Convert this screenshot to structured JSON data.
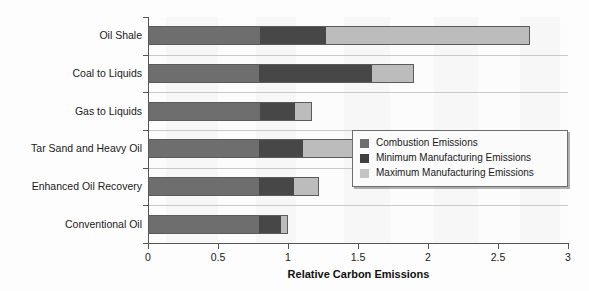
{
  "chart_data": {
    "type": "bar",
    "orientation": "horizontal",
    "stacked": true,
    "title": "",
    "xlabel": "Relative Carbon Emissions",
    "ylabel": "",
    "xlim": [
      0,
      3
    ],
    "xticks": [
      "0",
      "0.5",
      "1",
      "1.5",
      "2",
      "2.5",
      "3"
    ],
    "xtick_values": [
      0,
      0.5,
      1,
      1.5,
      2,
      2.5,
      3
    ],
    "grid": true,
    "grid_axis": "y",
    "legend_position": "center-right",
    "categories": [
      "Oil Shale",
      "Coal to Liquids",
      "Gas to Liquids",
      "Tar Sand and Heavy Oil",
      "Enhanced Oil Recovery",
      "Conventional Oil"
    ],
    "series": [
      {
        "name": "Combustion Emissions",
        "color": "#6e6e6e",
        "values": [
          0.8,
          0.79,
          0.8,
          0.79,
          0.79,
          0.79
        ]
      },
      {
        "name": "Minimum Manufacturing Emissions",
        "color": "#474747",
        "values": [
          0.47,
          0.81,
          0.25,
          0.32,
          0.25,
          0.16
        ]
      },
      {
        "name": "Maximum Manufacturing Emissions",
        "color": "#bcbcbc",
        "values": [
          1.46,
          0.3,
          0.12,
          0.37,
          0.18,
          0.05
        ]
      }
    ],
    "cumulative_totals": [
      [
        0.8,
        1.27,
        2.73
      ],
      [
        0.79,
        1.6,
        1.9
      ],
      [
        0.8,
        1.05,
        1.17
      ],
      [
        0.79,
        1.11,
        1.48
      ],
      [
        0.79,
        1.04,
        1.22
      ],
      [
        0.79,
        0.95,
        1.0
      ]
    ]
  },
  "legend": {
    "items": [
      {
        "label": "Combustion Emissions",
        "color": "#6e6e6e"
      },
      {
        "label": "Minimum Manufacturing Emissions",
        "color": "#3f3f3f"
      },
      {
        "label": "Maximum Manufacturing Emissions",
        "color": "#c4c4c4"
      }
    ]
  },
  "axis": {
    "x_title": "Relative Carbon Emissions"
  },
  "colors": {
    "axis": "#555555",
    "gridline": "#c9c9c9",
    "bar_outline": "#5a5a5a",
    "background": "#fdfdfd"
  }
}
